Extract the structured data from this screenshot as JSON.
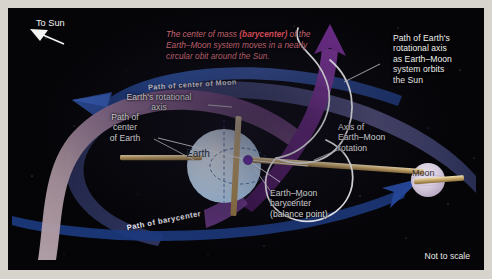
{
  "figure": {
    "kind": "astronomy-diagram",
    "background_color": "#050508",
    "page_color": "#d6d4cd"
  },
  "direction_marker": {
    "label": "To Sun",
    "arrow_icon": "arrow-up-left-icon"
  },
  "callout": {
    "text_before": "The center of mass ",
    "emphasis": "(barycenter)",
    "text_after": " of the Earth–Moon system moves in a nearly circular obit around the Sun.",
    "color": "#d9707a"
  },
  "labels": {
    "path_of_earths_axis": "Path of Earth's\nrotational axis\nas Earth–Moon\nsystem orbits\nthe Sun",
    "earths_rotational_axis": "Earth's rotational\naxis",
    "path_of_center_of_earth": "Path of\ncenter\nof Earth",
    "axis_of_rotation": "Axis of\nEarth–Moon\nrotation",
    "barycenter": "Earth–Moon\nbarycenter\n(balance point)",
    "not_to_scale": "Not to scale"
  },
  "ribbon_labels": {
    "path_of_center_of_moon": "Path of center of Moon",
    "path_of_barycenter": "Path of barycenter"
  },
  "bodies": {
    "earth": {
      "name": "Earth",
      "color": "#cfe2f2"
    },
    "moon": {
      "name": "Moon",
      "color": "#d9cfe0"
    }
  },
  "colors": {
    "moon_path_band": "#2a4a8f",
    "barycenter_path_band": "#8d7f92",
    "earth_path_ribbon": "#6b2f7a",
    "axis_rod": "#cdb07a",
    "barycenter_dot": "#6a2fae",
    "helix_curve": "#ffffff"
  }
}
